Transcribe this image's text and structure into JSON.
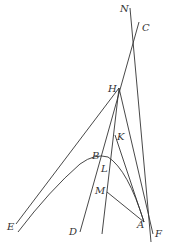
{
  "diagram": {
    "stroke_color": "#333333",
    "background": "#ffffff",
    "labels": {
      "N": "N",
      "C": "C",
      "H": "H",
      "K": "K",
      "B": "B",
      "L": "L",
      "M": "M",
      "E": "E",
      "D": "D",
      "A": "A",
      "F": "F"
    },
    "points": {
      "N": [
        130,
        8
      ],
      "C": [
        139,
        22
      ],
      "H": [
        119,
        88
      ],
      "K": [
        115,
        135
      ],
      "B": [
        97,
        156
      ],
      "L": [
        104,
        163
      ],
      "M": [
        107,
        192
      ],
      "E": [
        16,
        224
      ],
      "D": [
        80,
        232
      ],
      "A": [
        144,
        222
      ],
      "F": [
        153,
        234
      ]
    }
  }
}
